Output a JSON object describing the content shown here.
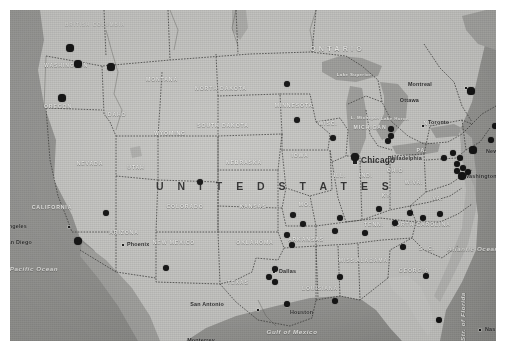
{
  "image": {
    "title": "Map of the United States with black location markers",
    "type": "scanned-political-map",
    "background_color": "#c8c8c6",
    "land_color": "#cfcfcc",
    "water_color": "#9a9a97",
    "marker_color": "#0b0b0b",
    "border_color": "#ffffff"
  },
  "country_label": "U N I T E D   S T A T E S",
  "provinces": [
    {
      "name": "ONTARIO",
      "x": 300,
      "y": 34
    },
    {
      "name": "BRITISH COLUMBIA",
      "x": 55,
      "y": 12
    }
  ],
  "states": [
    {
      "name": "WASHINGTON",
      "x": 56,
      "y": 55
    },
    {
      "name": "OREGON",
      "x": 48,
      "y": 96
    },
    {
      "name": "IDAHO",
      "x": 106,
      "y": 104
    },
    {
      "name": "MONTANA",
      "x": 152,
      "y": 69
    },
    {
      "name": "NORTH DAKOTA",
      "x": 211,
      "y": 78
    },
    {
      "name": "SOUTH DAKOTA",
      "x": 213,
      "y": 115
    },
    {
      "name": "WYOMING",
      "x": 160,
      "y": 123
    },
    {
      "name": "NEVADA",
      "x": 80,
      "y": 153
    },
    {
      "name": "UTAH",
      "x": 126,
      "y": 157
    },
    {
      "name": "COLORADO",
      "x": 175,
      "y": 196
    },
    {
      "name": "NEBRASKA",
      "x": 234,
      "y": 152
    },
    {
      "name": "MINNESOTA",
      "x": 284,
      "y": 95
    },
    {
      "name": "IOWA",
      "x": 290,
      "y": 145
    },
    {
      "name": "WISC.",
      "x": 318,
      "y": 113
    },
    {
      "name": "MICHIGAN",
      "x": 360,
      "y": 117
    },
    {
      "name": "KANSAS",
      "x": 243,
      "y": 196
    },
    {
      "name": "MO.",
      "x": 295,
      "y": 194
    },
    {
      "name": "ILL.",
      "x": 330,
      "y": 165
    },
    {
      "name": "IND.",
      "x": 356,
      "y": 165
    },
    {
      "name": "OHIO",
      "x": 385,
      "y": 160
    },
    {
      "name": "PA.",
      "x": 412,
      "y": 140
    },
    {
      "name": "N.Y.",
      "x": 420,
      "y": 113
    },
    {
      "name": "KY.",
      "x": 377,
      "y": 185
    },
    {
      "name": "W.VA.",
      "x": 404,
      "y": 172
    },
    {
      "name": "VA.",
      "x": 428,
      "y": 188
    },
    {
      "name": "CALIFORNIA",
      "x": 42,
      "y": 197
    },
    {
      "name": "ARIZONA",
      "x": 114,
      "y": 222
    },
    {
      "name": "NEW MEXICO",
      "x": 164,
      "y": 232
    },
    {
      "name": "OKLAHOMA",
      "x": 245,
      "y": 232
    },
    {
      "name": "ARKANSAS",
      "x": 296,
      "y": 229
    },
    {
      "name": "TENN.",
      "x": 364,
      "y": 214
    },
    {
      "name": "NORTH CAROLINA",
      "x": 411,
      "y": 214
    },
    {
      "name": "S.  C.",
      "x": 417,
      "y": 238
    },
    {
      "name": "MISS.",
      "x": 338,
      "y": 250
    },
    {
      "name": "ALABAMA",
      "x": 362,
      "y": 250
    },
    {
      "name": "GEORGIA",
      "x": 404,
      "y": 260
    },
    {
      "name": "LOUISIANA",
      "x": 310,
      "y": 278
    },
    {
      "name": "TEXAS",
      "x": 228,
      "y": 272
    }
  ],
  "water_labels": [
    {
      "name": "Lake Superior",
      "x": 344,
      "y": 64,
      "style": "lake"
    },
    {
      "name": "L. Michigan",
      "x": 355,
      "y": 107,
      "style": "lake"
    },
    {
      "name": "Lake Huron",
      "x": 385,
      "y": 108,
      "style": "lake"
    },
    {
      "name": "Pacific Ocean",
      "x": 24,
      "y": 258,
      "style": "ocean"
    },
    {
      "name": "Atlantic Ocean",
      "x": 463,
      "y": 238,
      "style": "ocean"
    },
    {
      "name": "Gulf of Mexico",
      "x": 282,
      "y": 321,
      "style": "ocean"
    },
    {
      "name": "Str. of Florida",
      "x": 449,
      "y": 331,
      "style": "vertical"
    }
  ],
  "cities": [
    {
      "name": "Montreal",
      "x": 456,
      "y": 78,
      "label_dx": -34,
      "label_dy": -4,
      "marker": "square",
      "size": "small"
    },
    {
      "name": "Ottawa",
      "x": 434,
      "y": 90,
      "label_dx": -25,
      "label_dy": 0,
      "marker": "none",
      "size": "small"
    },
    {
      "name": "Toronto",
      "x": 413,
      "y": 116,
      "label_dx": 5,
      "label_dy": -4,
      "marker": "square",
      "size": "small"
    },
    {
      "name": "Chicago",
      "x": 345,
      "y": 152,
      "label_dx": 6,
      "label_dy": -2,
      "marker": "square",
      "size": "big"
    },
    {
      "name": "New York",
      "x": 471,
      "y": 141,
      "label_dx": 5,
      "label_dy": 0,
      "marker": "none",
      "size": "small"
    },
    {
      "name": "Philadelphia",
      "x": 450,
      "y": 148,
      "label_dx": -38,
      "label_dy": 0,
      "marker": "none",
      "size": "small"
    },
    {
      "name": "Washington D.C.",
      "x": 450,
      "y": 166,
      "label_dx": 4,
      "label_dy": 0,
      "marker": "none",
      "size": "small"
    },
    {
      "name": "Los Angeles",
      "x": 59,
      "y": 217,
      "label_dx": -42,
      "label_dy": -1,
      "marker": "square",
      "size": "small"
    },
    {
      "name": "San Diego",
      "x": 62,
      "y": 233,
      "label_dx": -40,
      "label_dy": -1,
      "marker": "none",
      "size": "small"
    },
    {
      "name": "Phoenix",
      "x": 113,
      "y": 235,
      "label_dx": 4,
      "label_dy": -1,
      "marker": "square",
      "size": "small"
    },
    {
      "name": "Dallas",
      "x": 264,
      "y": 262,
      "label_dx": 5,
      "label_dy": -1,
      "marker": "square",
      "size": "small"
    },
    {
      "name": "San Antonio",
      "x": 248,
      "y": 300,
      "label_dx": -34,
      "label_dy": -6,
      "marker": "square",
      "size": "small"
    },
    {
      "name": "Houston",
      "x": 277,
      "y": 296,
      "label_dx": 3,
      "label_dy": 6,
      "marker": "square",
      "size": "small"
    },
    {
      "name": "Monterrey",
      "x": 215,
      "y": 330,
      "label_dx": -10,
      "label_dy": 0,
      "marker": "none",
      "size": "small"
    },
    {
      "name": "Nassau",
      "x": 470,
      "y": 320,
      "label_dx": 5,
      "label_dy": -1,
      "marker": "square",
      "size": "small"
    }
  ],
  "markers": {
    "count": 52,
    "color": "#0b0b0b",
    "points": [
      {
        "x": 60,
        "y": 38,
        "r": 3.6
      },
      {
        "x": 68,
        "y": 54,
        "r": 3.6
      },
      {
        "x": 101,
        "y": 57,
        "r": 3.6
      },
      {
        "x": 52,
        "y": 88,
        "r": 3.6
      },
      {
        "x": 277,
        "y": 74,
        "r": 3.4
      },
      {
        "x": 287,
        "y": 110,
        "r": 3.4
      },
      {
        "x": 323,
        "y": 128,
        "r": 3.4
      },
      {
        "x": 381,
        "y": 119,
        "r": 3.2
      },
      {
        "x": 381,
        "y": 126,
        "r": 3.2
      },
      {
        "x": 378,
        "y": 131,
        "r": 3.2
      },
      {
        "x": 345,
        "y": 147,
        "r": 3.6
      },
      {
        "x": 190,
        "y": 172,
        "r": 3.4
      },
      {
        "x": 96,
        "y": 203,
        "r": 3.4
      },
      {
        "x": 68,
        "y": 231,
        "r": 4.2
      },
      {
        "x": 156,
        "y": 258,
        "r": 3.4
      },
      {
        "x": 283,
        "y": 205,
        "r": 3.4
      },
      {
        "x": 293,
        "y": 214,
        "r": 3.4
      },
      {
        "x": 277,
        "y": 225,
        "r": 3.4
      },
      {
        "x": 282,
        "y": 235,
        "r": 3.4
      },
      {
        "x": 325,
        "y": 221,
        "r": 3.4
      },
      {
        "x": 330,
        "y": 208,
        "r": 3.4
      },
      {
        "x": 355,
        "y": 223,
        "r": 3.4
      },
      {
        "x": 369,
        "y": 199,
        "r": 3.4
      },
      {
        "x": 385,
        "y": 213,
        "r": 3.4
      },
      {
        "x": 400,
        "y": 203,
        "r": 3.4
      },
      {
        "x": 413,
        "y": 208,
        "r": 3.4
      },
      {
        "x": 430,
        "y": 204,
        "r": 3.4
      },
      {
        "x": 393,
        "y": 237,
        "r": 3.4
      },
      {
        "x": 265,
        "y": 259,
        "r": 3.4
      },
      {
        "x": 259,
        "y": 267,
        "r": 3.4
      },
      {
        "x": 265,
        "y": 272,
        "r": 3.4
      },
      {
        "x": 330,
        "y": 267,
        "r": 3.4
      },
      {
        "x": 325,
        "y": 291,
        "r": 3.4
      },
      {
        "x": 277,
        "y": 294,
        "r": 3.4
      },
      {
        "x": 434,
        "y": 148,
        "r": 3.4
      },
      {
        "x": 443,
        "y": 143,
        "r": 3.4
      },
      {
        "x": 450,
        "y": 148,
        "r": 3.4
      },
      {
        "x": 447,
        "y": 154,
        "r": 3.4
      },
      {
        "x": 453,
        "y": 158,
        "r": 3.4
      },
      {
        "x": 447,
        "y": 161,
        "r": 3.4
      },
      {
        "x": 452,
        "y": 166,
        "r": 3.8
      },
      {
        "x": 458,
        "y": 162,
        "r": 3.4
      },
      {
        "x": 463,
        "y": 140,
        "r": 3.6
      },
      {
        "x": 461,
        "y": 81,
        "r": 3.6
      },
      {
        "x": 485,
        "y": 116,
        "r": 3.0
      },
      {
        "x": 481,
        "y": 130,
        "r": 3.0
      },
      {
        "x": 416,
        "y": 266,
        "r": 3.4
      },
      {
        "x": 429,
        "y": 310,
        "r": 3.4
      }
    ]
  }
}
